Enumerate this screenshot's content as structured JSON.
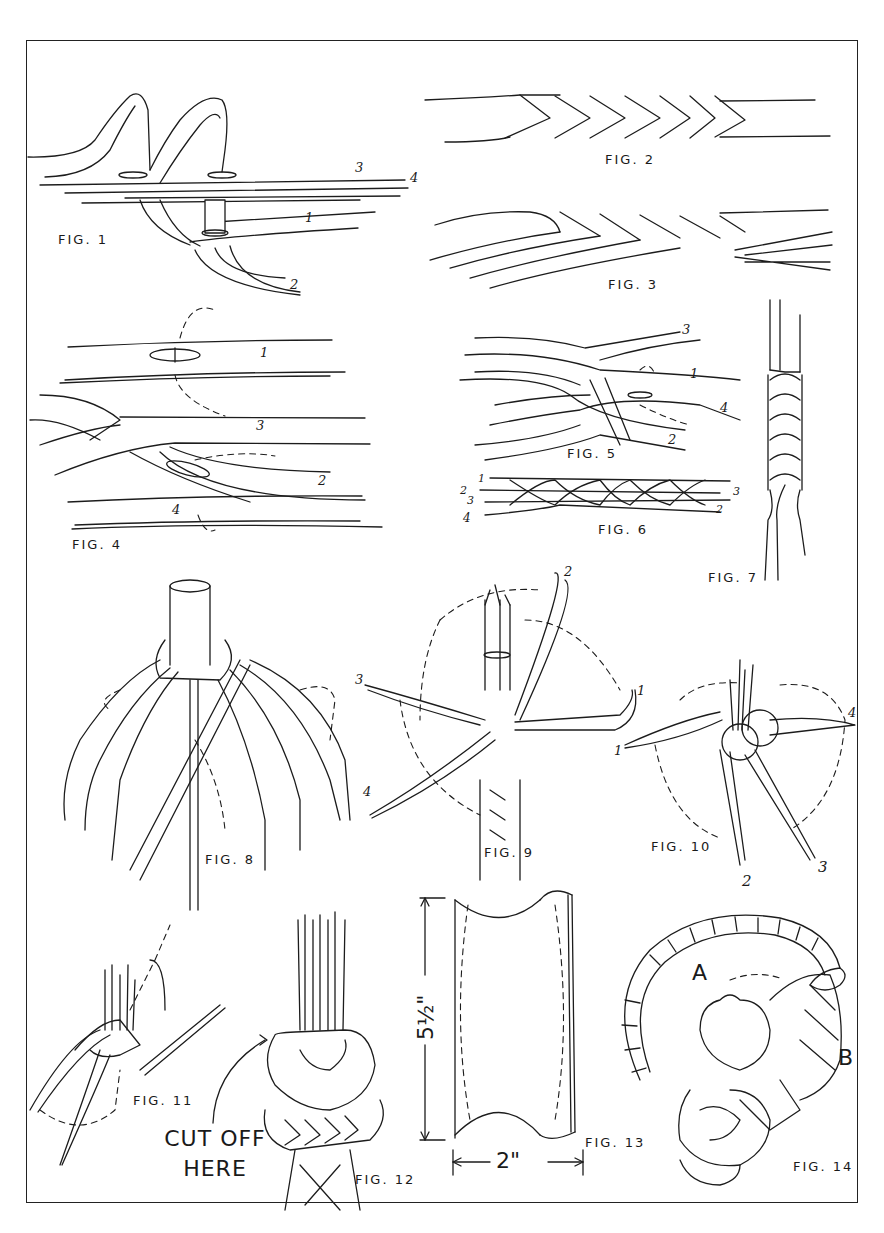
{
  "plate": {
    "title": "Braiding and knot-tying illustration plate",
    "figures": [
      {
        "id": "fig1",
        "caption": "FIG. 1",
        "strand_labels": [
          "1",
          "2",
          "3",
          "4"
        ]
      },
      {
        "id": "fig2",
        "caption": "FIG. 2"
      },
      {
        "id": "fig3",
        "caption": "FIG. 3"
      },
      {
        "id": "fig4",
        "caption": "FIG. 4",
        "strand_labels": [
          "1",
          "2",
          "3",
          "4"
        ]
      },
      {
        "id": "fig5",
        "caption": "FIG. 5",
        "strand_labels": [
          "1",
          "2",
          "3",
          "4"
        ]
      },
      {
        "id": "fig6",
        "caption": "FIG. 6",
        "strand_labels_left": [
          "1",
          "2",
          "3",
          "4"
        ],
        "strand_labels_right": [
          "3",
          "2"
        ]
      },
      {
        "id": "fig7",
        "caption": "FIG. 7"
      },
      {
        "id": "fig8",
        "caption": "FIG. 8"
      },
      {
        "id": "fig9",
        "caption": "FIG. 9",
        "strand_labels": [
          "1",
          "2",
          "3",
          "4"
        ]
      },
      {
        "id": "fig10",
        "caption": "FIG. 10",
        "strand_labels": [
          "1",
          "2",
          "3",
          "4"
        ]
      },
      {
        "id": "fig11",
        "caption": "FIG. 11"
      },
      {
        "id": "fig12",
        "caption": "FIG. 12",
        "annotation_line1": "CUT OFF",
        "annotation_line2": "HERE"
      },
      {
        "id": "fig13",
        "caption": "FIG. 13",
        "height_dim": "5½\"",
        "width_dim": "2\""
      },
      {
        "id": "fig14",
        "caption": "FIG. 14",
        "point_labels": [
          "A",
          "B"
        ]
      }
    ]
  }
}
